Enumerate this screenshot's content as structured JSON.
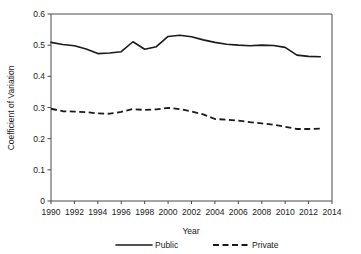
{
  "chart_data": {
    "type": "line",
    "title": "",
    "xlabel": "Year",
    "ylabel": "Coefficient of Variation",
    "xlim": [
      1990,
      2014
    ],
    "ylim": [
      0,
      0.6
    ],
    "grid": false,
    "legend_position": "bottom",
    "x": [
      1990,
      1991,
      1992,
      1993,
      1994,
      1995,
      1996,
      1997,
      1998,
      1999,
      2000,
      2001,
      2002,
      2003,
      2004,
      2005,
      2006,
      2007,
      2008,
      2009,
      2010,
      2011,
      2012,
      2013
    ],
    "xtick_labels": [
      "1990",
      "1992",
      "1994",
      "1996",
      "1998",
      "2000",
      "2002",
      "2004",
      "2006",
      "2008",
      "2010",
      "2012",
      "2014"
    ],
    "xtick_values": [
      1990,
      1992,
      1994,
      1996,
      1998,
      2000,
      2002,
      2004,
      2006,
      2008,
      2010,
      2012,
      2014
    ],
    "ytick_labels": [
      "0",
      "0.1",
      "0.2",
      "0.3",
      "0.4",
      "0.5",
      "0.6"
    ],
    "ytick_values": [
      0,
      0.1,
      0.2,
      0.3,
      0.4,
      0.5,
      0.6
    ],
    "series": [
      {
        "name": "Public",
        "style": "solid",
        "color": "#1a1a1a",
        "values": [
          0.509,
          0.502,
          0.498,
          0.488,
          0.473,
          0.475,
          0.479,
          0.511,
          0.487,
          0.495,
          0.528,
          0.532,
          0.527,
          0.517,
          0.509,
          0.503,
          0.5,
          0.498,
          0.5,
          0.499,
          0.493,
          0.468,
          0.464,
          0.463
        ]
      },
      {
        "name": "Private",
        "style": "dashed",
        "color": "#1a1a1a",
        "values": [
          0.296,
          0.288,
          0.287,
          0.285,
          0.281,
          0.28,
          0.286,
          0.295,
          0.292,
          0.294,
          0.299,
          0.295,
          0.287,
          0.278,
          0.263,
          0.261,
          0.258,
          0.253,
          0.249,
          0.245,
          0.238,
          0.231,
          0.231,
          0.232
        ]
      }
    ]
  },
  "legend": {
    "entries": [
      {
        "label": "Public",
        "style": "solid"
      },
      {
        "label": "Private",
        "style": "dashed"
      }
    ]
  },
  "axes": {
    "x_title": "Year",
    "y_title": "Coefficient of Variation"
  }
}
